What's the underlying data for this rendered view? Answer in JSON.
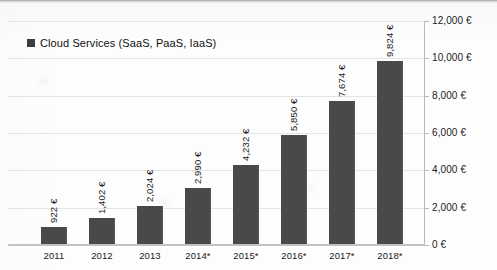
{
  "chart_data": {
    "type": "bar",
    "title": "",
    "xlabel": "",
    "ylabel": "",
    "categories": [
      "2011",
      "2012",
      "2013",
      "2014*",
      "2015*",
      "2016*",
      "2017*",
      "2018*"
    ],
    "values": [
      922,
      1402,
      2024,
      2990,
      4232,
      5850,
      7674,
      9824
    ],
    "value_labels": [
      "922 €",
      "1,402 €",
      "2,024 €",
      "2,990 €",
      "4,232 €",
      "5,850 €",
      "7,674 €",
      "9,824 €"
    ],
    "series": [
      {
        "name": "Cloud Services (SaaS, PaaS, IaaS)",
        "values": [
          922,
          1402,
          2024,
          2990,
          4232,
          5850,
          7674,
          9824
        ],
        "color": "#494949"
      }
    ],
    "ylim": [
      0,
      12000
    ],
    "ytick_values": [
      0,
      2000,
      4000,
      6000,
      8000,
      10000,
      12000
    ],
    "ytick_labels": [
      "0 €",
      "2,000 €",
      "4,000 €",
      "6,000 €",
      "8,000 €",
      "10,000 €",
      "12,000 €"
    ],
    "yaxis_position": "right",
    "grid": true,
    "legend_position": "top-left",
    "bar_color": "#494949",
    "gridline_color": "#e4e4e4",
    "data_label_rotation": "-90"
  },
  "legend": {
    "series_label": "Cloud Services (SaaS, PaaS, IaaS)",
    "swatch_color": "#3d3d3d"
  }
}
